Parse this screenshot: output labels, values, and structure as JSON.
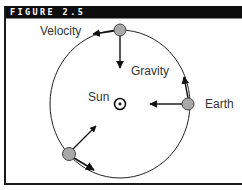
{
  "figure": {
    "title": "FIGURE 2.5"
  },
  "labels": {
    "velocity": "Velocity",
    "gravity": "Gravity",
    "sun": "Sun",
    "earth": "Earth"
  },
  "colors": {
    "header_bg": "#0d0d0d",
    "header_text": "#ffffff",
    "line": "#1a1a1a",
    "planet_fill": "#a8a8a8",
    "planet_stroke": "#444444"
  }
}
